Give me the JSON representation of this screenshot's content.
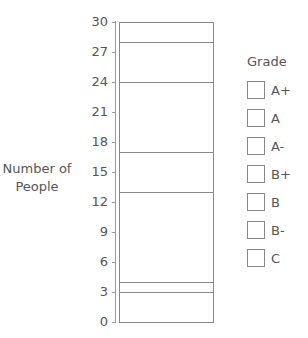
{
  "chart_data": {
    "type": "bar",
    "stacked": true,
    "title": "",
    "xlabel": "",
    "ylabel": "Number of People",
    "ylim": [
      0,
      30
    ],
    "yticks": [
      "0",
      "3",
      "6",
      "9",
      "12",
      "15",
      "18",
      "21",
      "24",
      "27",
      "30"
    ],
    "categories": [
      ""
    ],
    "legend_title": "Grade",
    "legend_position": "right",
    "grid": false,
    "series": [
      {
        "name": "C",
        "values": [
          3
        ]
      },
      {
        "name": "B-",
        "values": [
          1
        ]
      },
      {
        "name": "B",
        "values": [
          9
        ]
      },
      {
        "name": "B+",
        "values": [
          4
        ]
      },
      {
        "name": "A-",
        "values": [
          7
        ]
      },
      {
        "name": "A",
        "values": [
          4
        ]
      },
      {
        "name": "A+",
        "values": [
          2
        ]
      }
    ]
  },
  "ylabel_line1": "Number of",
  "ylabel_line2": "People",
  "legend": {
    "title": "Grade",
    "items": [
      "A+",
      "A",
      "A-",
      "B+",
      "B",
      "B-",
      "C"
    ]
  }
}
